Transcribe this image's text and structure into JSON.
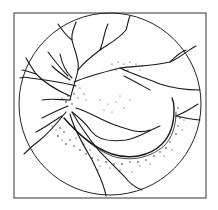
{
  "figure": {
    "type": "fundus-illustration",
    "frame": {
      "x": 14,
      "y": 13,
      "width": 192,
      "height": 185,
      "stroke": "#333333"
    },
    "circle": {
      "cx": 110,
      "cy": 104,
      "r": 91,
      "stroke": "#222222"
    },
    "colors": {
      "background": "#ffffff",
      "ink": "#1a1a1a"
    }
  }
}
